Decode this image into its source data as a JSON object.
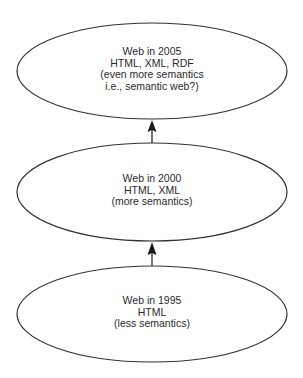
{
  "diagram": {
    "type": "evolution-flow",
    "direction": "bottom-to-top",
    "colors": {
      "stroke": "#333333",
      "text": "#2a2a2a",
      "background": "#ffffff"
    },
    "nodes": [
      {
        "id": "web-2005",
        "lines": [
          "Web in 2005",
          "HTML, XML, RDF",
          "(even more semantics",
          "i.e., semantic web?)"
        ]
      },
      {
        "id": "web-2000",
        "lines": [
          "Web in 2000",
          "HTML, XML",
          "(more semantics)"
        ]
      },
      {
        "id": "web-1995",
        "lines": [
          "Web in 1995",
          "HTML",
          "(less semantics)"
        ]
      }
    ],
    "edges": [
      {
        "from": "web-1995",
        "to": "web-2000"
      },
      {
        "from": "web-2000",
        "to": "web-2005"
      }
    ]
  }
}
